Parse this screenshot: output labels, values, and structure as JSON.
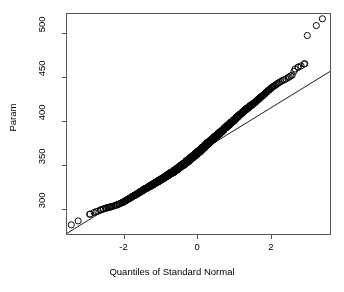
{
  "chart_data": {
    "type": "scatter",
    "title": "",
    "subtitle": "",
    "xlabel": "Quantiles of Standard Normal",
    "ylabel": "Param",
    "xlim": [
      -3.55,
      3.62
    ],
    "ylim": [
      271,
      522
    ],
    "xticks": [
      -2,
      0,
      2
    ],
    "xtick_labels": [
      "-2",
      "0",
      "2"
    ],
    "yticks": [
      300,
      350,
      400,
      450,
      500
    ],
    "ytick_labels": [
      "300",
      "350",
      "400",
      "450",
      "500"
    ],
    "grid": false,
    "legend": null,
    "point_marker": "open-circle",
    "point_radius_px": 3.1,
    "point_color": "#000000",
    "line_color": "#000000",
    "box_color": "#555555",
    "reference_line": {
      "description": "qqline through first and third quartiles",
      "x_start": -3.55,
      "y_start": 272.0,
      "x_end": 3.62,
      "y_end": 456.5
    },
    "n_points": 820,
    "points": [
      [
        -3.42,
        282.0
      ],
      [
        -2.92,
        294.0
      ],
      [
        -2.8,
        296.0
      ],
      [
        -2.7,
        297.5
      ],
      [
        -2.62,
        299.0
      ],
      [
        -2.55,
        300.0
      ],
      [
        -2.49,
        300.8
      ],
      [
        -2.43,
        301.5
      ],
      [
        -2.38,
        302.0
      ],
      [
        -2.33,
        302.6
      ],
      [
        -2.28,
        303.2
      ],
      [
        -2.24,
        303.8
      ],
      [
        -2.2,
        304.4
      ],
      [
        -2.16,
        305.0
      ],
      [
        -2.12,
        305.6
      ],
      [
        -2.08,
        306.4
      ],
      [
        -2.04,
        307.2
      ],
      [
        -2.0,
        308.0
      ],
      [
        -1.96,
        309.0
      ],
      [
        -1.92,
        310.0
      ],
      [
        -1.88,
        311.0
      ],
      [
        -1.84,
        312.0
      ],
      [
        -1.8,
        313.0
      ],
      [
        -1.76,
        314.0
      ],
      [
        -1.72,
        315.0
      ],
      [
        -1.68,
        316.0
      ],
      [
        -1.64,
        317.0
      ],
      [
        -1.6,
        318.0
      ],
      [
        -1.56,
        319.0
      ],
      [
        -1.52,
        320.0
      ],
      [
        -1.48,
        321.0
      ],
      [
        -1.44,
        322.0
      ],
      [
        -1.4,
        323.0
      ],
      [
        -1.36,
        324.0
      ],
      [
        -1.32,
        325.0
      ],
      [
        -1.28,
        326.0
      ],
      [
        -1.24,
        327.0
      ],
      [
        -1.2,
        328.0
      ],
      [
        -1.16,
        329.0
      ],
      [
        -1.12,
        330.0
      ],
      [
        -1.08,
        331.0
      ],
      [
        -1.04,
        332.0
      ],
      [
        -1.0,
        333.0
      ],
      [
        -0.96,
        334.0
      ],
      [
        -0.92,
        335.0
      ],
      [
        -0.88,
        336.0
      ],
      [
        -0.84,
        337.0
      ],
      [
        -0.8,
        338.5
      ],
      [
        -0.76,
        339.5
      ],
      [
        -0.72,
        340.5
      ],
      [
        -0.68,
        341.5
      ],
      [
        -0.64,
        342.5
      ],
      [
        -0.6,
        344.0
      ],
      [
        -0.56,
        345.0
      ],
      [
        -0.52,
        346.0
      ],
      [
        -0.48,
        347.5
      ],
      [
        -0.44,
        348.5
      ],
      [
        -0.4,
        350.0
      ],
      [
        -0.36,
        351.0
      ],
      [
        -0.32,
        352.5
      ],
      [
        -0.28,
        354.0
      ],
      [
        -0.24,
        355.0
      ],
      [
        -0.2,
        356.5
      ],
      [
        -0.16,
        358.0
      ],
      [
        -0.12,
        359.0
      ],
      [
        -0.08,
        360.5
      ],
      [
        -0.04,
        362.0
      ],
      [
        0.0,
        363.5
      ],
      [
        0.04,
        365.0
      ],
      [
        0.08,
        366.5
      ],
      [
        0.12,
        368.0
      ],
      [
        0.16,
        369.5
      ],
      [
        0.2,
        371.0
      ],
      [
        0.24,
        372.5
      ],
      [
        0.28,
        374.0
      ],
      [
        0.32,
        375.5
      ],
      [
        0.36,
        377.0
      ],
      [
        0.4,
        378.5
      ],
      [
        0.44,
        380.0
      ],
      [
        0.48,
        381.5
      ],
      [
        0.52,
        383.0
      ],
      [
        0.56,
        384.5
      ],
      [
        0.6,
        386.0
      ],
      [
        0.64,
        387.5
      ],
      [
        0.68,
        389.0
      ],
      [
        0.72,
        390.5
      ],
      [
        0.76,
        392.0
      ],
      [
        0.8,
        393.5
      ],
      [
        0.84,
        395.0
      ],
      [
        0.88,
        396.5
      ],
      [
        0.92,
        398.0
      ],
      [
        0.96,
        399.5
      ],
      [
        1.0,
        401.0
      ],
      [
        1.04,
        402.5
      ],
      [
        1.08,
        404.0
      ],
      [
        1.12,
        405.5
      ],
      [
        1.16,
        407.0
      ],
      [
        1.2,
        408.5
      ],
      [
        1.24,
        410.0
      ],
      [
        1.28,
        411.5
      ],
      [
        1.32,
        413.0
      ],
      [
        1.36,
        414.0
      ],
      [
        1.4,
        415.5
      ],
      [
        1.44,
        417.0
      ],
      [
        1.48,
        418.0
      ],
      [
        1.52,
        419.5
      ],
      [
        1.56,
        421.0
      ],
      [
        1.6,
        422.0
      ],
      [
        1.64,
        423.5
      ],
      [
        1.68,
        425.0
      ],
      [
        1.72,
        426.5
      ],
      [
        1.76,
        428.0
      ],
      [
        1.8,
        429.5
      ],
      [
        1.84,
        431.0
      ],
      [
        1.88,
        432.5
      ],
      [
        1.92,
        434.0
      ],
      [
        1.96,
        435.5
      ],
      [
        2.0,
        437.0
      ],
      [
        2.05,
        438.5
      ],
      [
        2.1,
        440.0
      ],
      [
        2.15,
        441.5
      ],
      [
        2.2,
        443.0
      ],
      [
        2.26,
        444.5
      ],
      [
        2.32,
        446.0
      ],
      [
        2.38,
        447.0
      ],
      [
        2.44,
        448.5
      ],
      [
        2.5,
        450.0
      ],
      [
        2.58,
        452.0
      ],
      [
        2.66,
        459.0
      ],
      [
        2.74,
        461.0
      ],
      [
        2.82,
        462.5
      ],
      [
        2.92,
        465.0
      ],
      [
        2.99,
        497.0
      ],
      [
        3.4,
        516.0
      ]
    ]
  },
  "axes": {
    "y_title": "Param",
    "x_title": "Quantiles of Standard Normal"
  }
}
